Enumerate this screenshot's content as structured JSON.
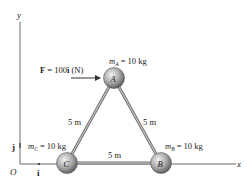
{
  "axes": {
    "x_label": "x",
    "y_label": "y",
    "origin_label": "O",
    "unit_i": "i",
    "unit_j": "j"
  },
  "force": {
    "label_prefix": "F",
    "label_eq": " = 100",
    "label_unit_vec": "i",
    "label_units": " (N)"
  },
  "masses": [
    {
      "id": "A",
      "symbol": "m",
      "sub": "A",
      "value": " = 10 kg"
    },
    {
      "id": "B",
      "symbol": "m",
      "sub": "B",
      "value": " = 10 kg"
    },
    {
      "id": "C",
      "symbol": "m",
      "sub": "C",
      "value": " = 10 kg"
    }
  ],
  "links": {
    "AC": "5 m",
    "AB": "5 m",
    "CB": "5 m"
  },
  "colors": {
    "ball_light": "#e8e8e8",
    "ball_dark": "#6a6a6a",
    "rod": "#8a8a8a",
    "axis": "#444444",
    "arrow": "#333333"
  }
}
